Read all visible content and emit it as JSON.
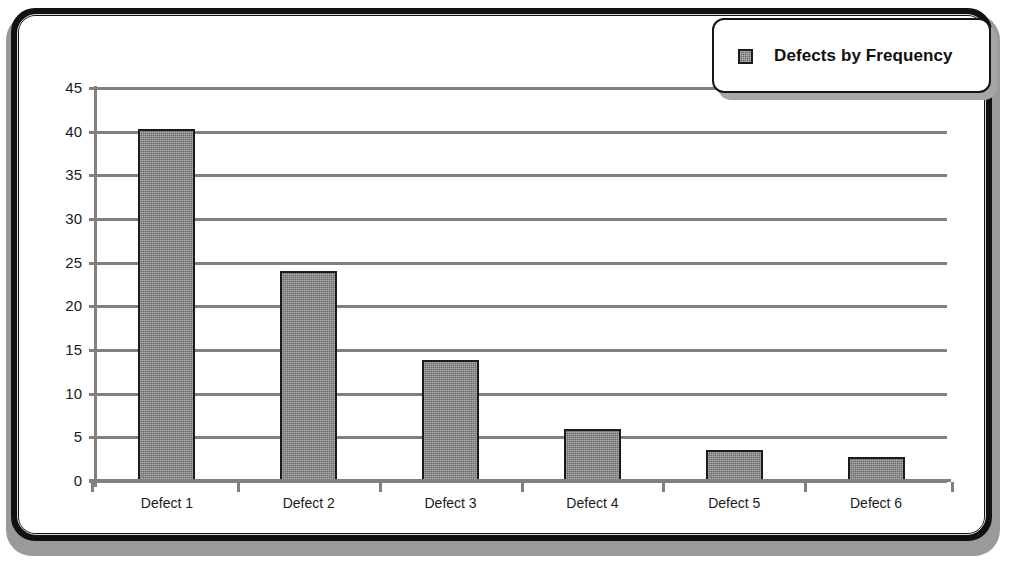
{
  "chart_data": {
    "type": "bar",
    "title": "",
    "xlabel": "",
    "ylabel": "",
    "categories": [
      "Defect 1",
      "Defect 2",
      "Defect 3",
      "Defect 4",
      "Defect 5",
      "Defect 6"
    ],
    "values": [
      40.3,
      24.1,
      13.8,
      6.0,
      3.6,
      2.8
    ],
    "series": [
      {
        "name": "Defects by Frequency",
        "values": [
          40.3,
          24.1,
          13.8,
          6.0,
          3.6,
          2.8
        ]
      }
    ],
    "ylim": [
      0,
      45
    ],
    "ytick_step": 5,
    "yticks": [
      "45",
      "40",
      "35",
      "30",
      "25",
      "20",
      "15",
      "10",
      "5",
      "0"
    ],
    "grid": true,
    "grid_axis": "y",
    "legend": {
      "position": "top-right",
      "entries": [
        {
          "label": "Defects by Frequency",
          "swatch_name": "legend-color-swatch"
        }
      ]
    },
    "colors": {
      "bar_fill": "#868686",
      "bar_border": "#1b1b1b",
      "gridline": "#808080",
      "axis": "#808080",
      "plot_background": "#ffffff",
      "frame_border": "#111111",
      "frame_shadow": "#9a9a9a",
      "text": "#1a1a1a"
    }
  }
}
